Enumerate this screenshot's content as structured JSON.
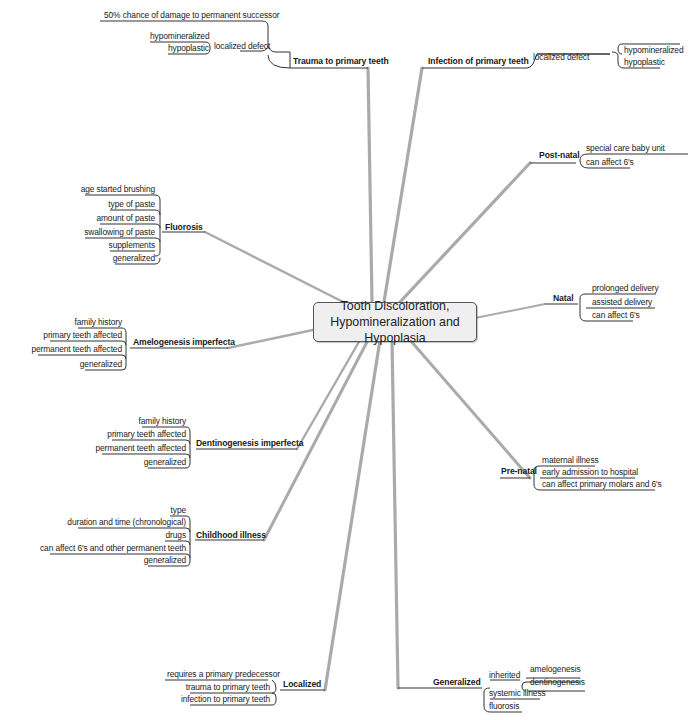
{
  "center": {
    "line1": "Tooth Discoloration,",
    "line2": "Hypomineralization and Hypoplasia"
  },
  "colors": {
    "branch": "#aaaaaa",
    "subline": "#333333",
    "center_fill": "#efefef",
    "center_border": "#555555"
  },
  "branches": {
    "trauma": {
      "label": "Trauma to primary teeth",
      "children": [
        "50% chance of damage to permanent successor",
        "localized defect"
      ],
      "localized_children": [
        "hypomineralized",
        "hypoplastic"
      ]
    },
    "infection": {
      "label": "Infection of primary teeth",
      "children": [
        "localized defect"
      ],
      "localized_children": [
        "hypomineralized",
        "hypoplastic"
      ]
    },
    "postnatal": {
      "label": "Post-natal",
      "children": [
        "special care baby unit",
        "can affect 6's"
      ]
    },
    "fluorosis": {
      "label": "Fluorosis",
      "children": [
        "age started brushing",
        "type of paste",
        "amount of paste",
        "swallowing of paste",
        "supplements",
        "generalized"
      ]
    },
    "natal": {
      "label": "Natal",
      "children": [
        "prolonged delivery",
        "assisted delivery",
        "can affect 6's"
      ]
    },
    "amelogenesis": {
      "label": "Amelogenesis imperfecta",
      "children": [
        "family history",
        "primary teeth affected",
        "permanent teeth affected",
        "generalized"
      ]
    },
    "dentinogenesis": {
      "label": "Dentinogenesis imperfecta",
      "children": [
        "family history",
        "primary teeth affected",
        "permanent teeth affected",
        "generalized"
      ]
    },
    "prenatal": {
      "label": "Pre-natal",
      "children": [
        "maternal illness",
        "early admission to hospital",
        "can affect primary molars and 6's"
      ]
    },
    "childhood": {
      "label": "Childhood illness",
      "children": [
        "type",
        "duration and time (chronological)",
        "drugs",
        "can affect 6's and other permanent teeth",
        "generalized"
      ]
    },
    "localized": {
      "label": "Localized",
      "children": [
        "requires a primary predecessor",
        "trauma to primary teeth",
        "infection to primary teeth"
      ]
    },
    "generalized": {
      "label": "Generalized",
      "children": [
        "inherited",
        "systemic illness",
        "fluorosis"
      ],
      "inherited_children": [
        "amelogenesis",
        "dentinogenesis"
      ]
    }
  }
}
